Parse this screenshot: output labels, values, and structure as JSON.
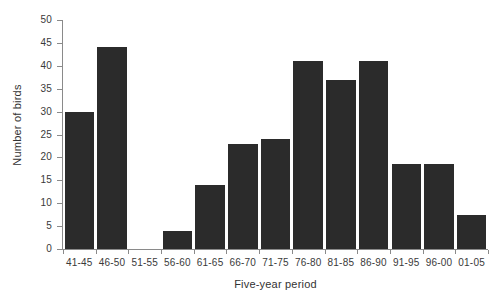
{
  "chart_data": {
    "type": "bar",
    "title": "",
    "xlabel": "Five-year period",
    "ylabel": "Number of birds",
    "categories": [
      "41-45",
      "46-50",
      "51-55",
      "56-60",
      "61-65",
      "66-70",
      "71-75",
      "76-80",
      "81-85",
      "86-90",
      "91-95",
      "96-00",
      "01-05"
    ],
    "values": [
      30,
      44,
      0,
      4,
      14,
      23,
      24,
      41,
      37,
      41,
      18.5,
      18.5,
      7.5
    ],
    "ylim": [
      0,
      50
    ],
    "ytick_values": [
      0,
      5,
      10,
      15,
      20,
      25,
      30,
      35,
      40,
      45,
      50
    ],
    "ytick_labels": [
      "0",
      "5",
      "10",
      "15",
      "20",
      "25",
      "30",
      "35",
      "40",
      "45",
      "50"
    ],
    "grid": false,
    "legend": "none",
    "bar_color": "#2b2b2b",
    "axis_color": "#8a8a8a",
    "background_color": "#ffffff"
  }
}
